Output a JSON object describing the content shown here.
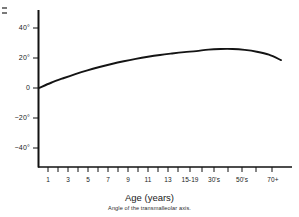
{
  "chart_data": {
    "type": "line",
    "title": "",
    "subtitle": "",
    "xlabel": "Age (years)",
    "ylabel": "",
    "caption": "Angle of the transmalleolar axis.",
    "grid": false,
    "legend": "none",
    "x_tick_labels": [
      "1",
      "",
      "3",
      "",
      "5",
      "",
      "7",
      "",
      "9",
      "",
      "11",
      "",
      "13",
      "",
      "15-19",
      "",
      "30's",
      "",
      "50's",
      "",
      "70+"
    ],
    "x_categories": [
      "1",
      "2",
      "3",
      "4",
      "5",
      "6",
      "7",
      "8",
      "9",
      "10",
      "11",
      "12",
      "13",
      "14",
      "15-19",
      "20's",
      "30's",
      "40's",
      "50's",
      "60's",
      "70+"
    ],
    "y_tick_labels": [
      "40°",
      "20°",
      "0",
      "−20°",
      "−40°"
    ],
    "y_tick_values": [
      40,
      20,
      0,
      -20,
      -40
    ],
    "ylim": [
      -50,
      50
    ],
    "series": [
      {
        "name": "Transmalleolar axis angle",
        "values": [
          0,
          3.5,
          6.5,
          9.3,
          11.8,
          14.0,
          16.0,
          17.8,
          19.4,
          20.8,
          22.0,
          23.0,
          23.9,
          24.6,
          25.6,
          26.0,
          26.0,
          25.4,
          24.2,
          22.2,
          18.6
        ]
      }
    ],
    "units": "degrees",
    "peak_value": 26,
    "peak_category": "20's",
    "start_value": 0,
    "end_value": 18.6
  },
  "figure": {
    "axis_title": "Age (years)",
    "caption": "Angle of the transmalleolar axis.",
    "line_color": "#141414",
    "axis_color": "#111111",
    "background": "#ffffff"
  }
}
